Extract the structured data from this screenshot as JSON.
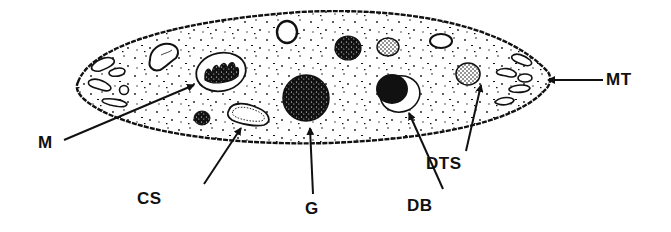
{
  "diagram": {
    "colors": {
      "ink": "#111111",
      "background": "#ffffff"
    },
    "labels": [
      {
        "id": "M",
        "text": "M",
        "x": 38,
        "y": 134
      },
      {
        "id": "CS",
        "text": "CS",
        "x": 137,
        "y": 190
      },
      {
        "id": "G",
        "text": "G",
        "x": 305,
        "y": 200
      },
      {
        "id": "DB",
        "text": "DB",
        "x": 407,
        "y": 197
      },
      {
        "id": "DTS",
        "text": "DTS",
        "x": 426,
        "y": 155
      },
      {
        "id": "MT",
        "text": "MT",
        "x": 606,
        "y": 71
      }
    ]
  }
}
